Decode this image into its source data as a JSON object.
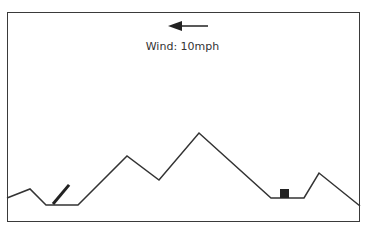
{
  "game": {
    "wind": {
      "label": "Wind: 10mph",
      "direction": "left",
      "speed_mph": 10
    },
    "terrain_points": [
      [
        7,
        198
      ],
      [
        30,
        189
      ],
      [
        46,
        205
      ],
      [
        78,
        205
      ],
      [
        127,
        156
      ],
      [
        159,
        180
      ],
      [
        199,
        133
      ],
      [
        271,
        198
      ],
      [
        304,
        198
      ],
      [
        319,
        173
      ],
      [
        360,
        206
      ]
    ],
    "player_cannon": {
      "x": 53,
      "y": 204,
      "angle_deg": 50,
      "barrel_length": 25
    },
    "enemy_tank": {
      "x": 280,
      "y": 189,
      "width": 9,
      "height": 9
    },
    "colors": {
      "line": "#333333",
      "tank": "#222222",
      "background": "#ffffff"
    }
  }
}
